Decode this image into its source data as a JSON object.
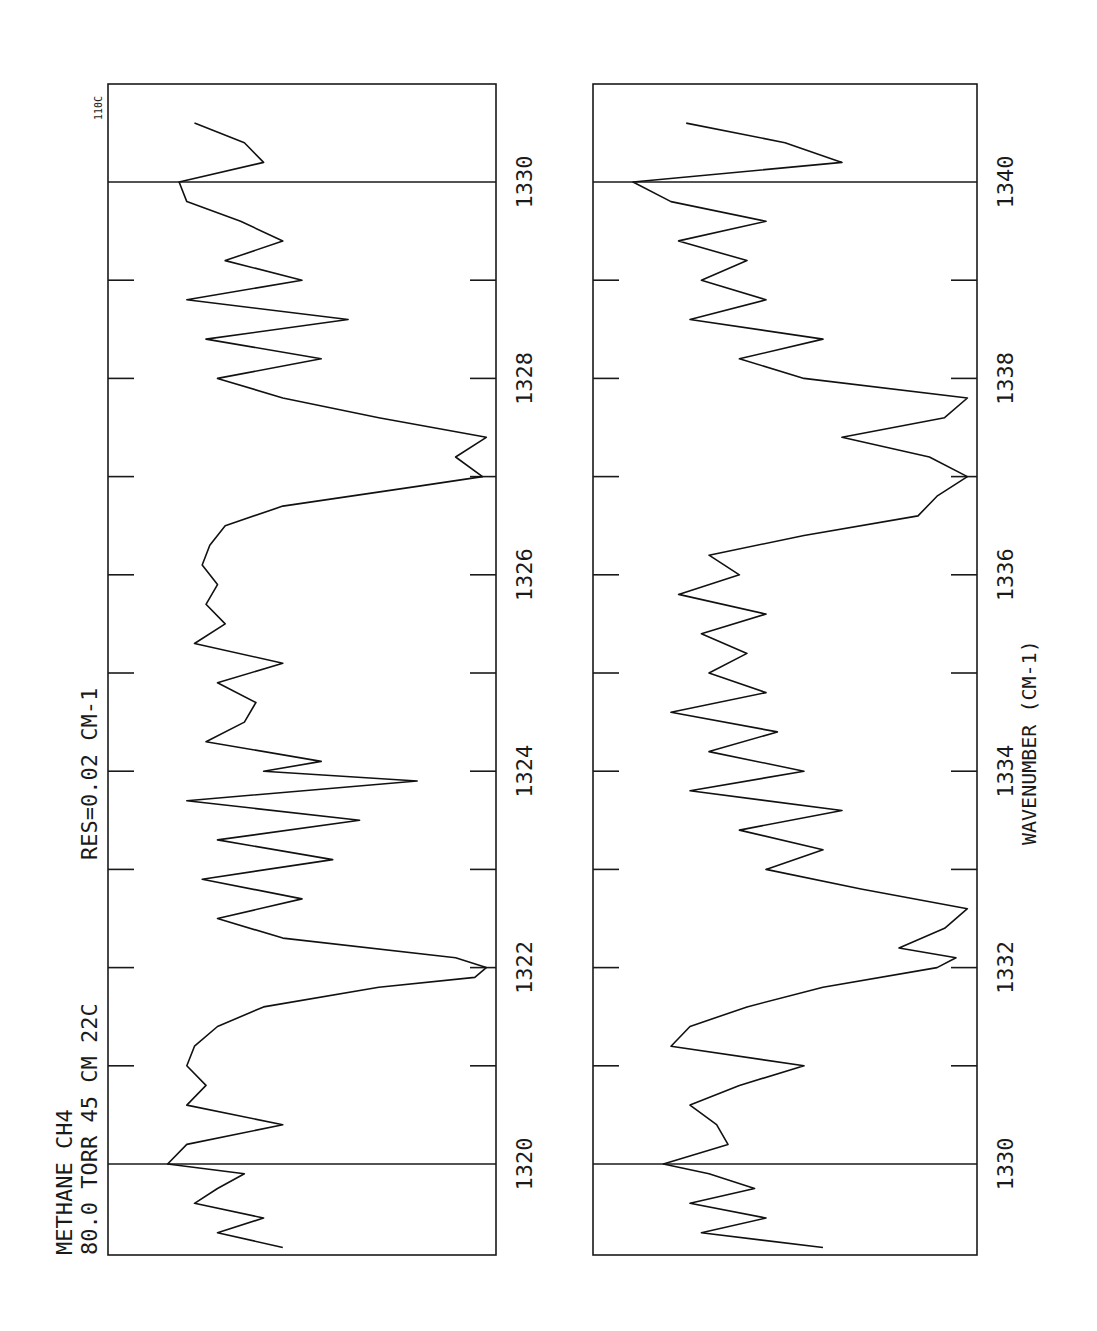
{
  "header": {
    "line1": "METHANE   CH4",
    "line2": "80.0 TORR  45 CM  22C",
    "resolution": "RES=0.02  CM-1",
    "page_tag": "110C"
  },
  "panels": [
    {
      "name": "upper",
      "ticks": [
        {
          "value": 1320,
          "label": "1320"
        },
        {
          "value": 1322,
          "label": "1322"
        },
        {
          "value": 1324,
          "label": "1324"
        },
        {
          "value": 1326,
          "label": "1326"
        },
        {
          "value": 1328,
          "label": "1328"
        },
        {
          "value": 1330,
          "label": "1330"
        }
      ]
    },
    {
      "name": "lower",
      "ticks": [
        {
          "value": 1330,
          "label": "1330"
        },
        {
          "value": 1332,
          "label": "1332"
        },
        {
          "value": 1334,
          "label": "1334"
        },
        {
          "value": 1336,
          "label": "1336"
        },
        {
          "value": 1338,
          "label": "1338"
        },
        {
          "value": 1340,
          "label": "1340"
        }
      ],
      "xlabel": "WAVENUMBER  (CM-1)"
    }
  ],
  "chart_data": [
    {
      "type": "line",
      "title": "METHANE CH4 80.0 TORR 45 CM 22C  RES=0.02 CM-1",
      "xlabel": "",
      "ylabel": "Transmittance (relative)",
      "xlim": [
        1319.1,
        1331.0
      ],
      "ylim": [
        0,
        1
      ],
      "grid": false,
      "x_ticks": [
        1320,
        1321,
        1322,
        1323,
        1324,
        1325,
        1326,
        1327,
        1328,
        1329,
        1330
      ],
      "x_tick_labels": [
        "1320",
        "1322",
        "1324",
        "1326",
        "1328",
        "1330"
      ],
      "annotations": [
        "vertical reference lines at 1320 and 1330"
      ],
      "series": [
        {
          "name": "CH4 spectrum (upper)",
          "x": [
            1319.15,
            1319.3,
            1319.45,
            1319.6,
            1319.75,
            1319.9,
            1320.0,
            1320.2,
            1320.4,
            1320.6,
            1320.8,
            1321.0,
            1321.2,
            1321.4,
            1321.6,
            1321.8,
            1321.9,
            1322.0,
            1322.1,
            1322.3,
            1322.5,
            1322.7,
            1322.9,
            1323.1,
            1323.3,
            1323.5,
            1323.7,
            1323.9,
            1324.0,
            1324.1,
            1324.3,
            1324.5,
            1324.7,
            1324.9,
            1325.1,
            1325.3,
            1325.5,
            1325.7,
            1325.9,
            1326.1,
            1326.3,
            1326.5,
            1326.7,
            1326.9,
            1327.0,
            1327.2,
            1327.4,
            1327.6,
            1327.8,
            1328.0,
            1328.2,
            1328.4,
            1328.6,
            1328.8,
            1329.0,
            1329.2,
            1329.4,
            1329.6,
            1329.8,
            1330.0,
            1330.2,
            1330.4,
            1330.6
          ],
          "y": [
            0.55,
            0.72,
            0.6,
            0.78,
            0.72,
            0.65,
            0.85,
            0.8,
            0.55,
            0.8,
            0.75,
            0.8,
            0.78,
            0.72,
            0.6,
            0.3,
            0.05,
            0.02,
            0.1,
            0.55,
            0.72,
            0.5,
            0.76,
            0.42,
            0.72,
            0.35,
            0.8,
            0.2,
            0.6,
            0.45,
            0.75,
            0.65,
            0.62,
            0.72,
            0.55,
            0.78,
            0.7,
            0.75,
            0.72,
            0.76,
            0.74,
            0.7,
            0.55,
            0.2,
            0.03,
            0.1,
            0.02,
            0.3,
            0.55,
            0.72,
            0.45,
            0.75,
            0.38,
            0.8,
            0.5,
            0.7,
            0.55,
            0.66,
            0.8,
            0.82,
            0.6,
            0.65,
            0.78
          ]
        }
      ]
    },
    {
      "type": "line",
      "title": "",
      "xlabel": "WAVENUMBER (CM-1)",
      "ylabel": "Transmittance (relative)",
      "xlim": [
        1329.1,
        1341.0
      ],
      "ylim": [
        0,
        1
      ],
      "grid": false,
      "x_ticks": [
        1330,
        1331,
        1332,
        1333,
        1334,
        1335,
        1336,
        1337,
        1338,
        1339,
        1340
      ],
      "x_tick_labels": [
        "1330",
        "1332",
        "1334",
        "1336",
        "1338",
        "1340"
      ],
      "annotations": [
        "vertical reference lines at 1330 and 1340"
      ],
      "series": [
        {
          "name": "CH4 spectrum (lower)",
          "x": [
            1329.15,
            1329.3,
            1329.45,
            1329.6,
            1329.75,
            1329.9,
            1330.0,
            1330.2,
            1330.4,
            1330.6,
            1330.8,
            1331.0,
            1331.2,
            1331.4,
            1331.6,
            1331.8,
            1332.0,
            1332.1,
            1332.2,
            1332.4,
            1332.6,
            1332.8,
            1333.0,
            1333.2,
            1333.4,
            1333.6,
            1333.8,
            1334.0,
            1334.2,
            1334.4,
            1334.6,
            1334.8,
            1335.0,
            1335.2,
            1335.4,
            1335.6,
            1335.8,
            1336.0,
            1336.2,
            1336.4,
            1336.6,
            1336.8,
            1337.0,
            1337.2,
            1337.4,
            1337.6,
            1337.8,
            1338.0,
            1338.2,
            1338.4,
            1338.6,
            1338.8,
            1339.0,
            1339.2,
            1339.4,
            1339.6,
            1339.8,
            1340.0,
            1340.2,
            1340.4,
            1340.6
          ],
          "y": [
            0.4,
            0.72,
            0.55,
            0.75,
            0.58,
            0.7,
            0.82,
            0.65,
            0.68,
            0.75,
            0.62,
            0.45,
            0.8,
            0.75,
            0.6,
            0.4,
            0.1,
            0.05,
            0.2,
            0.08,
            0.02,
            0.3,
            0.55,
            0.4,
            0.62,
            0.35,
            0.75,
            0.45,
            0.7,
            0.52,
            0.8,
            0.55,
            0.7,
            0.6,
            0.72,
            0.55,
            0.78,
            0.62,
            0.7,
            0.45,
            0.15,
            0.1,
            0.02,
            0.12,
            0.35,
            0.08,
            0.02,
            0.45,
            0.62,
            0.4,
            0.75,
            0.55,
            0.72,
            0.6,
            0.78,
            0.55,
            0.8,
            0.9,
            0.35,
            0.5,
            0.76
          ]
        }
      ]
    }
  ]
}
